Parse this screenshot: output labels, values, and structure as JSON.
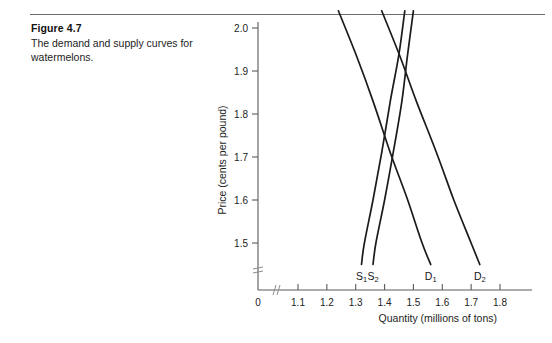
{
  "figure": {
    "number": "Figure 4.7",
    "caption": "The demand and supply curves for watermelons."
  },
  "chart_data": {
    "type": "line",
    "title": "",
    "xlabel": "Quantity (millions of tons)",
    "ylabel": "Price (cents per pound)",
    "xlim": [
      1.05,
      1.85
    ],
    "ylim": [
      1.44,
      2.05
    ],
    "grid": false,
    "legend_position": "inline-curve-labels",
    "x_origin_label": "0",
    "axis_break": true,
    "xticks": [
      "1.1",
      "1.2",
      "1.3",
      "1.4",
      "1.5",
      "1.6",
      "1.7",
      "1.8"
    ],
    "xtick_values": [
      1.1,
      1.2,
      1.3,
      1.4,
      1.5,
      1.6,
      1.7,
      1.8
    ],
    "yticks": [
      "1.5",
      "1.6",
      "1.7",
      "1.8",
      "1.9",
      "2.0"
    ],
    "ytick_values": [
      1.5,
      1.6,
      1.7,
      1.8,
      1.9,
      2.0
    ],
    "series": [
      {
        "name": "D1",
        "label_text": "D",
        "label_sub": "1",
        "kind": "demand",
        "points": [
          [
            1.24,
            2.04
          ],
          [
            1.3,
            1.94
          ],
          [
            1.36,
            1.83
          ],
          [
            1.42,
            1.71
          ],
          [
            1.48,
            1.6
          ],
          [
            1.53,
            1.5
          ],
          [
            1.56,
            1.45
          ]
        ]
      },
      {
        "name": "D2",
        "label_text": "D",
        "label_sub": "2",
        "kind": "demand",
        "points": [
          [
            1.39,
            2.04
          ],
          [
            1.45,
            1.94
          ],
          [
            1.51,
            1.83
          ],
          [
            1.58,
            1.71
          ],
          [
            1.64,
            1.6
          ],
          [
            1.7,
            1.5
          ],
          [
            1.73,
            1.45
          ]
        ]
      },
      {
        "name": "S1",
        "label_text": "S",
        "label_sub": "1",
        "kind": "supply",
        "points": [
          [
            1.47,
            2.04
          ],
          [
            1.45,
            1.94
          ],
          [
            1.42,
            1.83
          ],
          [
            1.39,
            1.71
          ],
          [
            1.36,
            1.6
          ],
          [
            1.33,
            1.5
          ],
          [
            1.32,
            1.45
          ]
        ]
      },
      {
        "name": "S2",
        "label_text": "S",
        "label_sub": "2",
        "kind": "supply",
        "points": [
          [
            1.5,
            2.04
          ],
          [
            1.48,
            1.94
          ],
          [
            1.46,
            1.83
          ],
          [
            1.43,
            1.71
          ],
          [
            1.4,
            1.6
          ],
          [
            1.37,
            1.5
          ],
          [
            1.36,
            1.45
          ]
        ]
      }
    ],
    "curve_labels": [
      {
        "name": "S1",
        "text": "S",
        "sub": "1"
      },
      {
        "name": "S2",
        "text": "S",
        "sub": "2"
      },
      {
        "name": "D1",
        "text": "D",
        "sub": "1"
      },
      {
        "name": "D2",
        "text": "D",
        "sub": "2"
      }
    ]
  }
}
